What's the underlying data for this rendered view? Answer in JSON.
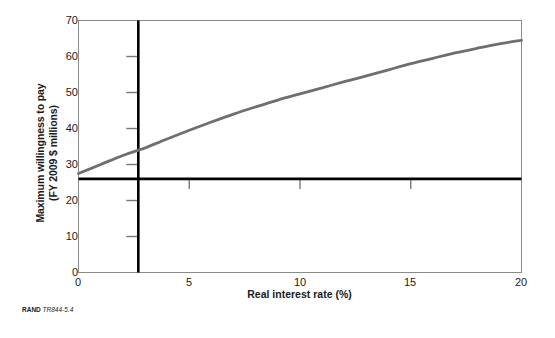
{
  "figure": {
    "source_prefix": "RAND",
    "source_code": "TR844-5.4"
  },
  "chart_data": {
    "type": "line",
    "title": "",
    "xlabel": "Real interest rate (%)",
    "ylabel_line1": "Maximum willingness to pay",
    "ylabel_line2": "(FY 2009 $ millions)",
    "xlim": [
      0,
      20
    ],
    "ylim": [
      0,
      70
    ],
    "xticks": [
      0,
      5,
      10,
      15,
      20
    ],
    "xtick_labels": [
      "0",
      "5",
      "10",
      "15",
      "20"
    ],
    "yticks": [
      0,
      10,
      20,
      30,
      40,
      50,
      60,
      70
    ],
    "ytick_labels": [
      "0",
      "10",
      "20",
      "30",
      "40",
      "50",
      "60",
      "70"
    ],
    "grid": false,
    "legend": "none",
    "series": [
      {
        "name": "Maximum willingness to pay",
        "color": "#6e6e6e",
        "x": [
          0,
          1,
          2,
          2.7,
          3,
          4,
          5,
          6,
          7,
          8,
          9,
          10,
          11,
          12,
          13,
          14,
          15,
          16,
          17,
          18,
          19,
          20
        ],
        "y": [
          27.5,
          30.0,
          32.5,
          34.0,
          34.6,
          37.1,
          39.5,
          41.8,
          44.0,
          46.0,
          47.9,
          49.6,
          51.3,
          53.0,
          54.6,
          56.3,
          58.0,
          59.5,
          61.0,
          62.3,
          63.5,
          64.5
        ]
      }
    ],
    "annotations": {
      "vertical_reference_line": {
        "name": "real-interest-rate-reference",
        "x": 2.7,
        "color": "#000000"
      },
      "horizontal_reference_line": {
        "name": "willingness-to-pay-reference",
        "y": 26.0,
        "color": "#000000"
      },
      "inner_y_tick_marks": [
        10,
        20,
        30,
        40,
        50,
        60
      ],
      "inner_x_tick_marks": [
        5,
        10,
        15
      ]
    }
  }
}
